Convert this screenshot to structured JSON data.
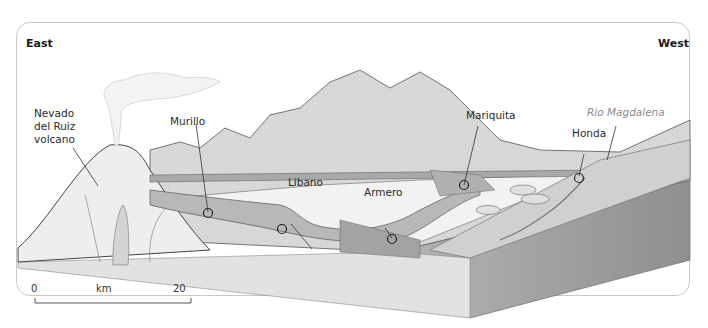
{
  "directions": {
    "left": "East",
    "right": "West"
  },
  "labels": {
    "volcano": [
      "Nevado",
      "del Ruiz",
      "volcano"
    ],
    "murillo": "Murillo",
    "libano": "Libano",
    "armero": "Armero",
    "mariquita": "Mariquita",
    "honda": "Honda",
    "river": "Rio Magdalena"
  },
  "scale": {
    "start": "0",
    "unit": "km",
    "end": "20"
  },
  "colors": {
    "terrain_light": "#e6e6e6",
    "terrain_mid": "#bdbdbd",
    "lahar_flow": "#a9a9a9",
    "block_side": "#9e9e9e",
    "outline": "#3a3a3a",
    "river_text": "#8a8a8a"
  }
}
